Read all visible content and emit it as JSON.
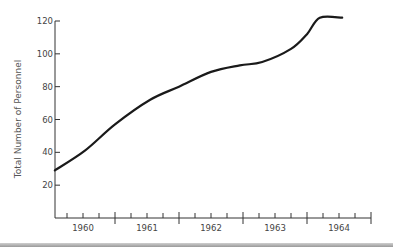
{
  "chart_data": {
    "type": "line",
    "title": "",
    "xlabel": "",
    "ylabel": "Total Number of Personnel",
    "x_tick_labels": [
      "1960",
      "1961",
      "1962",
      "1963",
      "1964"
    ],
    "y_ticks": [
      20,
      40,
      60,
      80,
      100,
      120
    ],
    "ylim": [
      0,
      120
    ],
    "xlim": [
      1960,
      1965
    ],
    "x_minor_ticks_per_year": 4,
    "grid": false,
    "legend": null,
    "series": [
      {
        "name": "Total Number of Personnel",
        "color": "#1a1a1a",
        "x": [
          1960.06,
          1960.53,
          1961.0,
          1961.55,
          1962.0,
          1962.5,
          1962.95,
          1963.3,
          1963.75,
          1964.0,
          1964.2,
          1964.55
        ],
        "values": [
          29,
          41,
          57,
          72,
          80,
          89,
          93,
          95,
          103,
          112,
          122,
          122
        ]
      }
    ]
  },
  "colors": {
    "axis": "#333333",
    "line": "#1a1a1a",
    "label": "#444444",
    "bottom_bar": "#a8a8a8"
  }
}
